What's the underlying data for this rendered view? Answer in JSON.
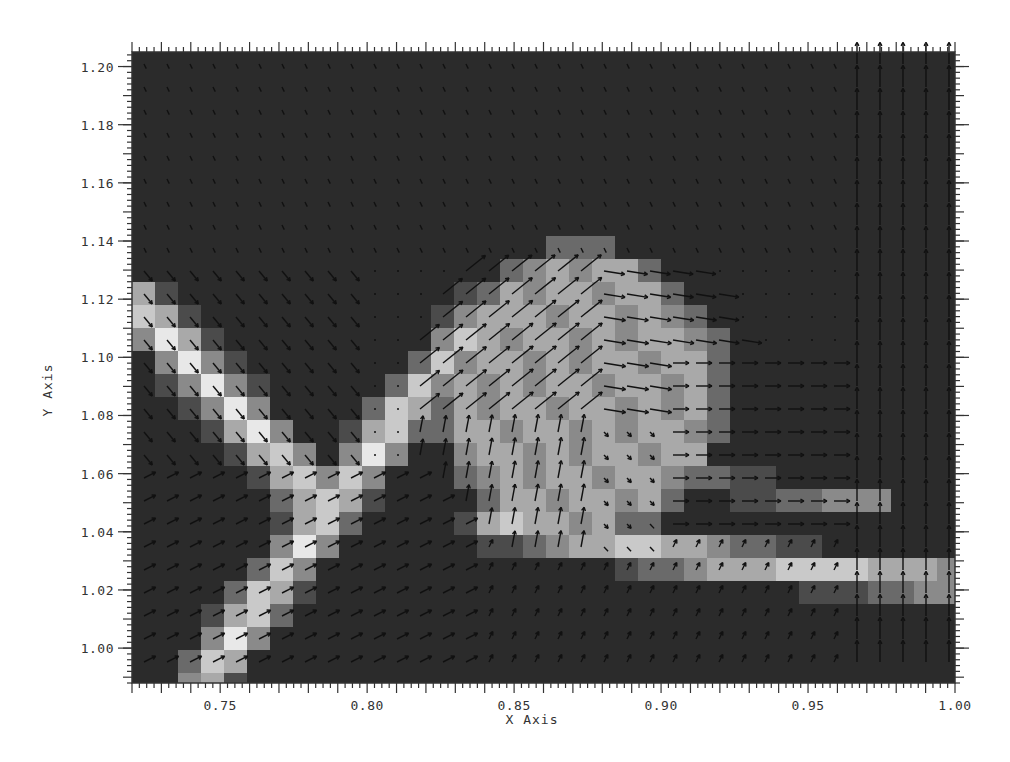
{
  "chart_data": {
    "type": "heatmap",
    "subtype": "scalar field with vector (quiver) overlay",
    "title": "",
    "xlabel": "X Axis",
    "ylabel": "Y Axis",
    "xlim": [
      0.72,
      1.0
    ],
    "ylim": [
      0.988,
      1.205
    ],
    "x_ticks": [
      0.75,
      0.8,
      0.85,
      0.9,
      0.95,
      1.0
    ],
    "x_tick_labels": [
      "0.75",
      "0.80",
      "0.85",
      "0.90",
      "0.95",
      "1.00"
    ],
    "y_ticks": [
      1.0,
      1.02,
      1.04,
      1.06,
      1.08,
      1.1,
      1.12,
      1.14,
      1.16,
      1.18,
      1.2
    ],
    "y_tick_labels": [
      "1.00",
      "1.02",
      "1.04",
      "1.06",
      "1.08",
      "1.10",
      "1.12",
      "1.14",
      "1.16",
      "1.18",
      "1.20"
    ],
    "colormap": "grayscale (dark = low, light = high)",
    "grid": false,
    "legend": null,
    "features": [
      {
        "name": "left diagonal filament",
        "from": [
          0.72,
          1.12
        ],
        "to": [
          0.78,
          1.05
        ],
        "intensity": "high"
      },
      {
        "name": "rising filament",
        "from": [
          0.75,
          0.99
        ],
        "to": [
          0.83,
          1.1
        ],
        "intensity": "high"
      },
      {
        "name": "vortex blob",
        "center": [
          0.875,
          1.085
        ],
        "radius_x": 0.04,
        "radius_y": 0.045,
        "intensity": "medium-high",
        "flow": "counter-clockwise swirl, arrows point up-right then right"
      },
      {
        "name": "lower band",
        "from": [
          0.84,
          1.04
        ],
        "to": [
          1.0,
          1.02
        ],
        "intensity": "high"
      },
      {
        "name": "right vertical jets",
        "x": [
          0.975,
          0.985,
          0.995
        ],
        "flow": "strong upward vectors"
      }
    ]
  },
  "figure": {
    "background": "#ffffff",
    "plot_background": "#2b2b2b",
    "cell_light": "#e8e8e8",
    "cell_dark": "#2b2b2b",
    "arrow_color": "#111111",
    "axis_color": "#333333"
  }
}
